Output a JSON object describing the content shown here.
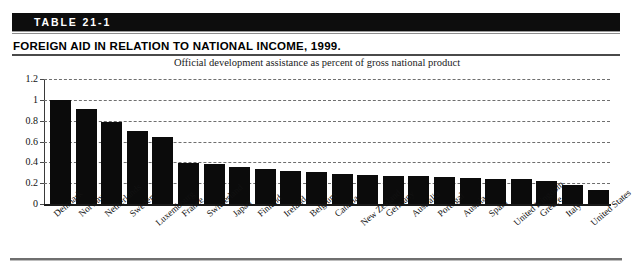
{
  "table": {
    "badge_label": "TABLE 21-1",
    "title": "FOREIGN AID IN RELATION TO NATIONAL INCOME, 1999.",
    "subtitle": "Official development assistance as percent of gross national product"
  },
  "colors": {
    "bar": "#0b0b0b",
    "band": "#0d0d0d",
    "grid": "#6f6f6f",
    "rule": "#8d8d8d"
  },
  "chart_data": {
    "type": "bar",
    "title": "FOREIGN AID IN RELATION TO NATIONAL INCOME, 1999.",
    "subtitle": "Official development assistance as percent of gross national product",
    "xlabel": "",
    "ylabel": "",
    "ylim": [
      0,
      1.2
    ],
    "ytick_labels": [
      "1.2",
      "1",
      "0.8",
      "0.6",
      "0.4",
      "0.2",
      "0"
    ],
    "ytick_values": [
      1.2,
      1.0,
      0.8,
      0.6,
      0.4,
      0.2,
      0
    ],
    "grid": "horizontal-dashed",
    "legend": "none",
    "categories": [
      "Denmark",
      "Norway",
      "Netherlands",
      "Sweden",
      "Luxembourg",
      "France",
      "Switzerland",
      "Japan",
      "Finland",
      "Ireland",
      "Belgium",
      "Canada",
      "New Zealand",
      "Germany",
      "Australia",
      "Portugal",
      "Austria",
      "Spain",
      "United Kingdom",
      "Greece",
      "Italy",
      "United States"
    ],
    "values": [
      1.0,
      0.91,
      0.79,
      0.7,
      0.64,
      0.39,
      0.38,
      0.36,
      0.34,
      0.32,
      0.31,
      0.29,
      0.28,
      0.27,
      0.27,
      0.26,
      0.25,
      0.24,
      0.24,
      0.22,
      0.18,
      0.13
    ]
  }
}
